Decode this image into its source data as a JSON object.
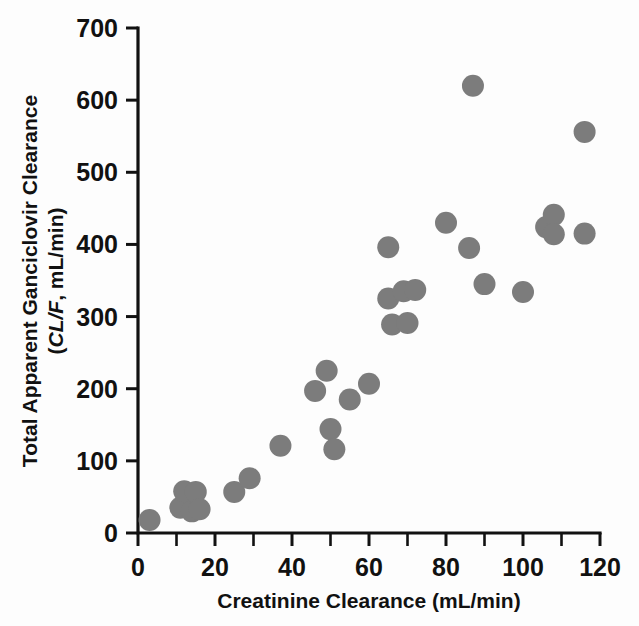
{
  "chart_data": {
    "type": "scatter",
    "title": "",
    "xlabel": "Creatinine Clearance (mL/min)",
    "ylabel_line1": "Total Apparent Ganciclovir Clearance",
    "ylabel_line2_italic": "CL/F",
    "ylabel_line2_rest": ", mL/min)",
    "ylabel_line2_open": "(",
    "ylabel_full": "Total Apparent Ganciclovir Clearance (CL/F, mL/min)",
    "xlim": [
      0,
      120
    ],
    "ylim": [
      0,
      700
    ],
    "xticks": [
      0,
      20,
      40,
      60,
      80,
      100,
      120
    ],
    "yticks": [
      0,
      100,
      200,
      300,
      400,
      500,
      600,
      700
    ],
    "xtick_labels": [
      "0",
      "20",
      "40",
      "60",
      "80",
      "100",
      "120"
    ],
    "ytick_labels": [
      "0",
      "100",
      "200",
      "300",
      "400",
      "500",
      "600",
      "700"
    ],
    "x_minor_interval": 10,
    "grid": false,
    "legend": false,
    "marker_color": "#7c7c7c",
    "marker_shape": "circle",
    "marker_diameter_px": 22,
    "points": [
      {
        "x": 3,
        "y": 18
      },
      {
        "x": 11,
        "y": 35
      },
      {
        "x": 12,
        "y": 58
      },
      {
        "x": 14,
        "y": 30
      },
      {
        "x": 15,
        "y": 57
      },
      {
        "x": 16,
        "y": 33
      },
      {
        "x": 25,
        "y": 57
      },
      {
        "x": 29,
        "y": 76
      },
      {
        "x": 37,
        "y": 121
      },
      {
        "x": 46,
        "y": 197
      },
      {
        "x": 49,
        "y": 225
      },
      {
        "x": 50,
        "y": 144
      },
      {
        "x": 51,
        "y": 116
      },
      {
        "x": 55,
        "y": 185
      },
      {
        "x": 60,
        "y": 207
      },
      {
        "x": 65,
        "y": 396
      },
      {
        "x": 65,
        "y": 325
      },
      {
        "x": 66,
        "y": 289
      },
      {
        "x": 69,
        "y": 335
      },
      {
        "x": 70,
        "y": 291
      },
      {
        "x": 72,
        "y": 337
      },
      {
        "x": 80,
        "y": 430
      },
      {
        "x": 87,
        "y": 620
      },
      {
        "x": 86,
        "y": 395
      },
      {
        "x": 90,
        "y": 345
      },
      {
        "x": 100,
        "y": 334
      },
      {
        "x": 106,
        "y": 424
      },
      {
        "x": 108,
        "y": 441
      },
      {
        "x": 108,
        "y": 414
      },
      {
        "x": 116,
        "y": 556
      },
      {
        "x": 116,
        "y": 415
      }
    ]
  }
}
